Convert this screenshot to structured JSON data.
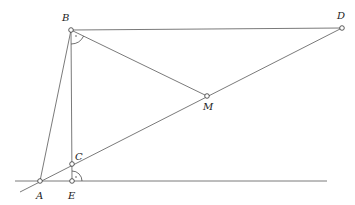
{
  "diagram": {
    "type": "geometry-construction",
    "points": [
      {
        "id": "A",
        "label": "A",
        "x": 40,
        "y": 181,
        "lx": 36,
        "ly": 199
      },
      {
        "id": "B",
        "label": "B",
        "x": 71,
        "y": 30,
        "lx": 62,
        "ly": 21
      },
      {
        "id": "C",
        "label": "C",
        "x": 72,
        "y": 164,
        "lx": 75,
        "ly": 160
      },
      {
        "id": "D",
        "label": "D",
        "x": 342,
        "y": 28,
        "lx": 337,
        "ly": 19
      },
      {
        "id": "E",
        "label": "E",
        "x": 72,
        "y": 181,
        "lx": 68,
        "ly": 199
      },
      {
        "id": "M",
        "label": "M",
        "x": 207,
        "y": 96,
        "lx": 203,
        "ly": 110
      }
    ],
    "segments": [
      {
        "from": "baseline-left",
        "to": "baseline-right",
        "x1": 15,
        "y1": 181,
        "x2": 327,
        "y2": 181
      },
      {
        "from": "ext",
        "to": "D",
        "x1": 20,
        "y1": 192,
        "x2": 342,
        "y2": 28
      },
      {
        "from": "A",
        "to": "B",
        "x1": 40,
        "y1": 181,
        "x2": 71,
        "y2": 30
      },
      {
        "from": "B",
        "to": "D",
        "x1": 71,
        "y1": 30,
        "x2": 342,
        "y2": 28
      },
      {
        "from": "B",
        "to": "E",
        "x1": 71,
        "y1": 30,
        "x2": 72,
        "y2": 181
      },
      {
        "from": "B",
        "to": "M",
        "x1": 71,
        "y1": 30,
        "x2": 207,
        "y2": 96
      }
    ],
    "angle_marks": [
      {
        "at": "B",
        "type": "right-angle-arc",
        "note": "between BE and BM"
      },
      {
        "at": "E",
        "type": "right-angle-arc",
        "note": "between EC and baseline"
      }
    ]
  }
}
